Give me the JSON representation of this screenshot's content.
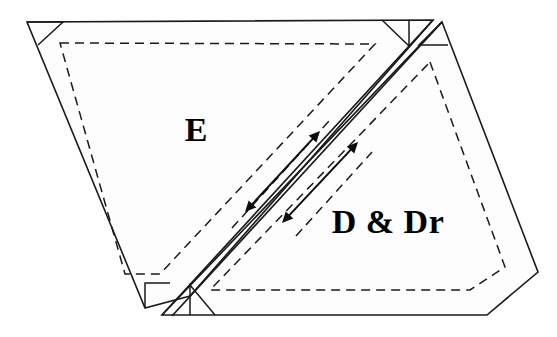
{
  "diagram": {
    "background_color": "#ffffff",
    "stroke_color": "#1a1a1a",
    "region_fill_color": "#fdfdfd",
    "arrow_color": "#0d0d0d",
    "canvas": {
      "width": 557,
      "height": 337
    },
    "regions": [
      {
        "id": "region-e",
        "label": "E",
        "label_position": {
          "x": 196,
          "y": 133
        },
        "outline_points": "27,22 433,20 190,296 145,308",
        "inner_dashed_points": "60,43 375,44 160,274 125,274",
        "corner_marks": [
          {
            "id": "corner-mark-e-topleft",
            "points": "27,22 63,22 38,45"
          },
          {
            "id": "corner-mark-e-topright",
            "points": "409,20 409,46 382,20"
          },
          {
            "id": "corner-mark-e-bottomleft",
            "points": "145,308 145,283 170,283"
          }
        ]
      },
      {
        "id": "region-ddr",
        "label": "D & Dr",
        "label_position": {
          "x": 388,
          "y": 225
        },
        "outline_points": "442,22 538,272 487,315 162,315",
        "inner_dashed_points": "430,62 505,267 470,290 210,290",
        "corner_marks": [
          {
            "id": "corner-mark-ddr-topright",
            "points": "442,22 419,45 448,45"
          },
          {
            "id": "corner-mark-ddr-bottomleft",
            "points": "190,315 190,285 215,315"
          }
        ]
      }
    ],
    "seam": {
      "id": "diagonal-seam",
      "description": "double-line diagonal joint between region E and region D & Dr",
      "line_a": {
        "x1": 433,
        "y1": 20,
        "x2": 162,
        "y2": 315
      },
      "line_b": {
        "x1": 442,
        "y1": 22,
        "x2": 172,
        "y2": 316
      }
    },
    "arrows": [
      {
        "id": "seam-arrow-upper",
        "type": "double-headed",
        "label": "",
        "start": {
          "x": 245,
          "y": 212
        },
        "end": {
          "x": 320,
          "y": 131
        }
      },
      {
        "id": "seam-arrow-lower",
        "type": "double-headed",
        "label": "",
        "start": {
          "x": 282,
          "y": 223
        },
        "end": {
          "x": 358,
          "y": 142
        }
      }
    ],
    "dashed_guides": [
      {
        "id": "dashed-guide-upper-seam",
        "points": "232,228 330,120"
      },
      {
        "id": "dashed-guide-lower-seam",
        "points": "296,236 372,152"
      }
    ]
  }
}
